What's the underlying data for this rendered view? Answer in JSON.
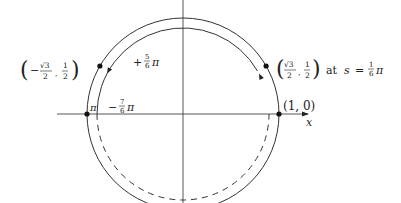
{
  "diagram": {
    "axes": {
      "x_label": "x"
    },
    "points": [
      {
        "id": "p1",
        "label": "(1, 0)",
        "angle_deg": 0
      },
      {
        "id": "pi",
        "label": "π",
        "angle_deg": 180
      },
      {
        "id": "p_sqrt3",
        "label_prefix": "(",
        "label_num": "√3",
        "label_den": "2",
        "label_sep": ",",
        "label_num2": "1",
        "label_den2": "2",
        "label_suffix": ")",
        "tail_text": "at",
        "tail_var": "s",
        "tail_eq": "=",
        "tail_frac_num": "1",
        "tail_frac_den": "6",
        "tail_pi": "π",
        "angle_deg": 30
      },
      {
        "id": "p_neg_sqrt3",
        "label_prefix": "(",
        "label_minus": "−",
        "label_num": "√3",
        "label_den": "2",
        "label_sep": ",",
        "label_num2": "1",
        "label_den2": "2",
        "label_suffix": ")",
        "angle_deg": 150
      }
    ],
    "arcs": [
      {
        "id": "positive",
        "sign": "+",
        "frac_num": "5",
        "frac_den": "6",
        "pi": "π",
        "style": "solid",
        "direction": "counterclockwise"
      },
      {
        "id": "negative",
        "sign": "−",
        "frac_num": "7",
        "frac_den": "6",
        "pi": "π",
        "style": "dashed",
        "direction": "clockwise"
      }
    ]
  }
}
